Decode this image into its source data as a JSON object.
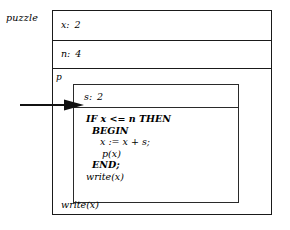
{
  "diagram": {
    "type": "activation-record-stack",
    "outer_frame": {
      "label": "puzzle",
      "slots": [
        {
          "name": "x:",
          "value": "2"
        },
        {
          "name": "n:",
          "value": "4"
        }
      ],
      "tail_statement": "write(x)"
    },
    "inner_frame": {
      "label": "p",
      "slots": [
        {
          "name": "s:",
          "value": "2"
        }
      ],
      "code": [
        "IF x <= n THEN",
        "BEGIN",
        "x := x + s;",
        "p(x)",
        "END;",
        "write(x)"
      ]
    },
    "pointer": {
      "name": "execution-pointer",
      "target_line": "IF x <= n THEN"
    },
    "colors": {
      "ink": "#1a1a1a",
      "background": "#ffffff"
    }
  }
}
